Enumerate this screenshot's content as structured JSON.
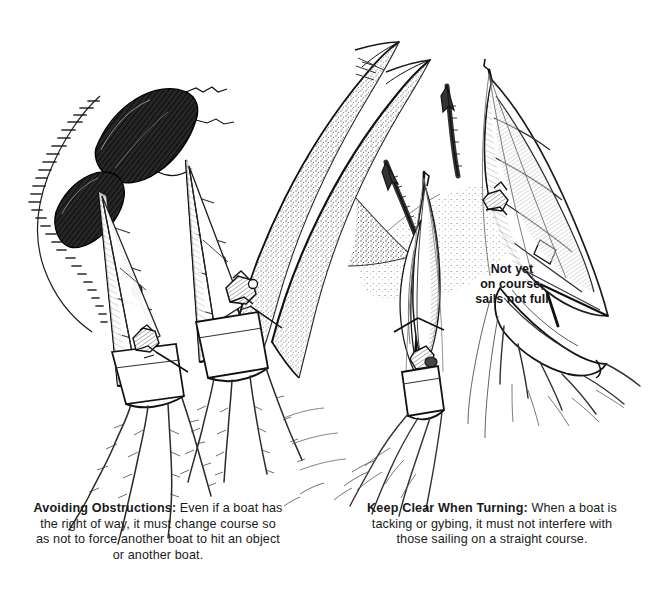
{
  "page": {
    "background_color": "#ffffff",
    "ink_color": "#1a1a1a",
    "width": 653,
    "height": 606,
    "medium": "pen-and-ink stipple illustration"
  },
  "illustration": {
    "left_scene": {
      "name": "avoiding-obstructions-scene",
      "description": "Two sailboats viewed from astern sailing toward a dark rocky obstruction; large stippled wind-curve sweeps to the right; wakes trail behind both hulls.",
      "elements": [
        "rock-obstruction",
        "sailboat-windward",
        "sailboat-leeward",
        "mainsail",
        "jib",
        "sail-battens",
        "sail-window",
        "crew-figure",
        "boat-wake",
        "wind-curve"
      ]
    },
    "right_scene": {
      "name": "keep-clear-when-turning-scene",
      "description": "Two sailboats, the nearer one tacking with luffing sails while the farther one sails a straight course; two sketched course arrows point up and left; stippled wave shadow between them.",
      "elements": [
        "sailboat-tacking",
        "sailboat-straight-course",
        "course-arrow-left",
        "course-arrow-right",
        "luffing-sail",
        "boom",
        "crew-figure",
        "boat-wake",
        "wave-shadow"
      ]
    },
    "annotation": {
      "name": "not-yet-on-course-label",
      "lines": [
        "Not yet",
        "on course,",
        "sails not full"
      ]
    }
  },
  "captions": {
    "left": {
      "lead": "Avoiding Obstructions:",
      "body": " Even if a boat has the right of way, it must change course so as not to force another boat to hit an object or another boat."
    },
    "right": {
      "lead": "Keep Clear When Turning:",
      "body": " When a boat is tacking or gybing, it must not interfere with those sailing on a straight course."
    }
  }
}
